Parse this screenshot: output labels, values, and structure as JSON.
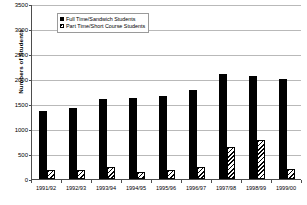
{
  "chart_data": {
    "type": "bar",
    "title": "",
    "xlabel": "",
    "ylabel": "Numbers of Students",
    "ylim": [
      0,
      3500
    ],
    "ytick_step": 500,
    "yticks": [
      "0",
      "500",
      "1000",
      "1500",
      "2000",
      "2500",
      "3000",
      "3500"
    ],
    "grid": true,
    "legend_position": "top-center-inside",
    "categories": [
      "1991/92",
      "1992/93",
      "1993/94",
      "1994/95",
      "1995/96",
      "1996/97",
      "1997/98",
      "1998/99",
      "1999/00"
    ],
    "series": [
      {
        "name": "Full Time/Sandwich Students",
        "color": "#000000",
        "fill": "solid-black",
        "values": [
          1370,
          1420,
          1600,
          1620,
          1670,
          1790,
          2100,
          2070,
          2000
        ]
      },
      {
        "name": "Part Time/Short Course Students",
        "color": "#000000",
        "fill": "diagonal-hatch",
        "values": [
          190,
          180,
          240,
          150,
          190,
          240,
          640,
          780,
          200
        ]
      }
    ]
  },
  "legend": {
    "entries": [
      {
        "label": "Full Time/Sandwich Students"
      },
      {
        "label": "Part Time/Short Course Students"
      }
    ]
  },
  "axes": {
    "y_title": "Numbers of Students"
  },
  "colors": {
    "axis": "#4d4d4d",
    "gridline": "#b9b9b9",
    "background": "#ffffff",
    "series_full": "#000000",
    "series_part": "#000000"
  }
}
